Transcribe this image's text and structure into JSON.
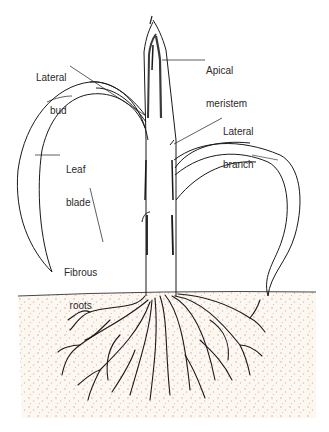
{
  "diagram": {
    "colors": {
      "ink": "#1a1a1a",
      "soil_dots": "#d9a98a",
      "soil_bg": "#fbf4ee",
      "background": "#ffffff"
    },
    "labels": [
      {
        "id": "lateral-bud",
        "lines": [
          "Lateral",
          "bud"
        ]
      },
      {
        "id": "apical-meristem",
        "lines": [
          "Apical",
          "meristem"
        ]
      },
      {
        "id": "lateral-branch",
        "lines": [
          "Lateral",
          "branch"
        ]
      },
      {
        "id": "leaf-blade",
        "lines": [
          "Leaf",
          "blade"
        ]
      },
      {
        "id": "fibrous-roots",
        "lines": [
          "Fibrous",
          "roots"
        ]
      }
    ]
  }
}
